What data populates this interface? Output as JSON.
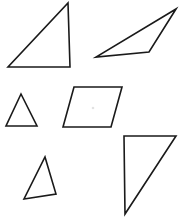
{
  "figure": {
    "width": 181,
    "height": 222,
    "background_color": "#ffffff",
    "stroke_color": "#1a1a1a",
    "fill_color": "#ffffff",
    "stroke_width": 1.6,
    "shape_count": 6,
    "shape_count_label": "6"
  },
  "shapes": [
    {
      "id": "shape-1",
      "name": "right-triangle-top-left",
      "type": "triangle",
      "subtype": "right triangle",
      "vertex_count": 3,
      "points": "68,3 70,67 8,67",
      "position": "top-left"
    },
    {
      "id": "shape-2",
      "name": "obtuse-triangle-top-right",
      "type": "triangle",
      "subtype": "obtuse scalene triangle",
      "vertex_count": 3,
      "points": "176,9 149,52 96,57",
      "position": "top-right"
    },
    {
      "id": "shape-3",
      "name": "isosceles-triangle-middle-left",
      "type": "triangle",
      "subtype": "isosceles triangle",
      "vertex_count": 3,
      "points": "21,94 37,126 6,126",
      "position": "middle-left"
    },
    {
      "id": "shape-4",
      "name": "parallelogram-middle-center",
      "type": "parallelogram",
      "subtype": "parallelogram",
      "vertex_count": 4,
      "points": "74,87 122,87 111,127 63,127",
      "position": "middle-center"
    },
    {
      "id": "shape-5",
      "name": "scalene-triangle-bottom-left",
      "type": "triangle",
      "subtype": "scalene triangle",
      "vertex_count": 3,
      "points": "45,157 56,194 24,199",
      "position": "bottom-left"
    },
    {
      "id": "shape-6",
      "name": "right-triangle-bottom-right",
      "type": "triangle",
      "subtype": "right triangle",
      "vertex_count": 3,
      "points": "124,136 176,136 125,214",
      "position": "bottom-right"
    }
  ],
  "marks": [
    {
      "id": "mark-1",
      "name": "faint-speck",
      "cx": 93,
      "cy": 108,
      "r": 1.3,
      "color": "#e2e2e2"
    }
  ]
}
